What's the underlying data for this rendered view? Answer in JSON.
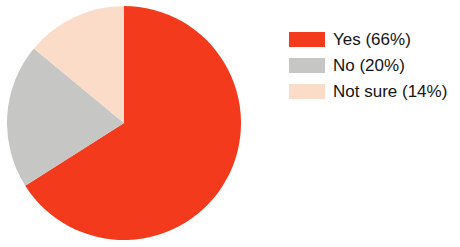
{
  "chart_data": {
    "type": "pie",
    "title": "",
    "subtitle": "",
    "xlabel": "",
    "ylabel": "",
    "grid": false,
    "legend_position": "right",
    "start_angle_deg": 0,
    "direction": "clockwise",
    "categories": [
      "Yes",
      "No",
      "Not sure"
    ],
    "values": [
      66,
      20,
      14
    ],
    "value_unit": "%",
    "colors": [
      "#F43A1C",
      "#C6C7C5",
      "#FBDCC8"
    ],
    "slices": [
      {
        "label": "Yes",
        "value": 66,
        "display_value": "66%",
        "legend_text": "Yes (66%)",
        "color": "#F43A1C",
        "start_deg": 0,
        "end_deg": 237.6
      },
      {
        "label": "No",
        "value": 20,
        "display_value": "20%",
        "legend_text": "No (20%)",
        "color": "#C6C7C5",
        "start_deg": 237.6,
        "end_deg": 309.6
      },
      {
        "label": "Not sure",
        "value": 14,
        "display_value": "14%",
        "legend_text": "Not sure (14%)",
        "color": "#FBDCC8",
        "start_deg": 309.6,
        "end_deg": 360
      }
    ],
    "annotations": []
  },
  "legend": {
    "items": [
      {
        "text": "Yes (66%)",
        "color": "#F43A1C"
      },
      {
        "text": "No (20%)",
        "color": "#C6C7C5"
      },
      {
        "text": "Not sure (14%)",
        "color": "#FBDCC8"
      }
    ]
  },
  "background_color": "#FFFFFF",
  "text_color": "#151515"
}
